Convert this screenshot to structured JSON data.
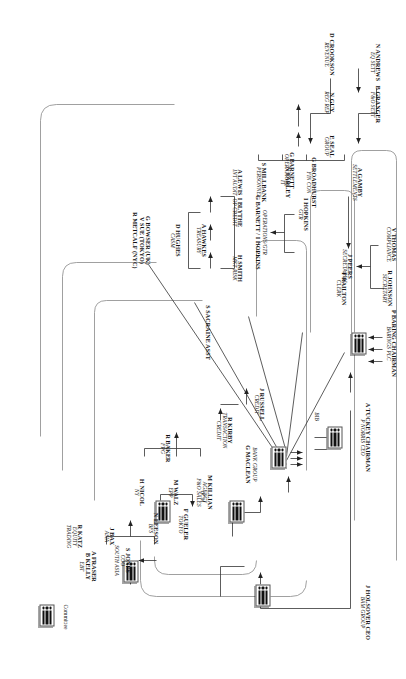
{
  "chart": {
    "type": "org-chart",
    "orientation": "rotated-90-clockwise"
  },
  "legend": {
    "committee_label": "Committee"
  },
  "nodes": {
    "baring": {
      "name": "P BARING CHAIRMAN",
      "role": "BARINGS PLC"
    },
    "tuckey": {
      "name": "A TUCKEY CHAIRMAN",
      "role": "P NORRIS CEO",
      "tag": "BIB"
    },
    "sacraine": {
      "name": "S SACRAINE ASST",
      "role": ""
    },
    "peers": {
      "name": "J PEERS",
      "role": "SECRETARIAL"
    },
    "johnson": {
      "name": "R JOHNSON",
      "role": "SECRETARY"
    },
    "railton": {
      "name": "T RAILTON",
      "role": "CLERK"
    },
    "thomas": {
      "name": "V THOMAS",
      "role": "COMPLIANCE"
    },
    "opsgtr": {
      "name": "OPERATIONS/GTR",
      "role": "G BARNETT / I HOPKINS"
    },
    "hopkins": {
      "name": "I HOPKINS",
      "role": "GTR"
    },
    "barnett": {
      "name": "G BARNETT",
      "role": "OPERATIONS"
    },
    "andrews": {
      "name": "N ANDREWS",
      "role": "EQ SETT"
    },
    "granger": {
      "name": "B GRANGER",
      "role": "F&O SETT"
    },
    "crookson": {
      "name": "D CROOKSON",
      "role": "REVENUE"
    },
    "guy": {
      "name": "N GUY",
      "role": "REG REP"
    },
    "seal": {
      "name": "E SEAL",
      "role": "GROUP"
    },
    "gamby": {
      "name": "A GAMBY",
      "role": "SETTLEMENTS"
    },
    "broadhurst": {
      "name": "G BROADHURST",
      "role": "FIN CON"
    },
    "farley": {
      "name": "N FARLEY",
      "role": "IT"
    },
    "millbank": {
      "name": "S MILLBANK",
      "role": "PERSONNEL"
    },
    "lewis": {
      "name": "A LEWIS",
      "role": "INT AUDIT"
    },
    "smith": {
      "name": "H SMITH",
      "role": "MKT RISK"
    },
    "hawkes": {
      "name": "A HAWKES",
      "role": "TREASURY"
    },
    "hughes": {
      "name": "D HUGHES",
      "role": "CASM"
    },
    "blythe": {
      "name": "I BLYTHE",
      "role": "OP CREDIT"
    },
    "bowser": {
      "name": "G BOWSER (UK)",
      "role": "V SUE (TOKYO)",
      "role2": "R METCALF (NYC)"
    },
    "russell": {
      "name": "J RUSSELL",
      "role": "CREDIT"
    },
    "kirby": {
      "name": "R KIRBY",
      "role": "TRANSACTION",
      "role2": "CREDIT"
    },
    "bankgroup": {
      "name": "BANK GROUP",
      "role": "G MACLEAN"
    },
    "bcm": {
      "name": "",
      "role": "BCM"
    },
    "baker": {
      "name": "R BAKER",
      "role": "FPG"
    },
    "nicol": {
      "name": "H NICOL",
      "role": "NY"
    },
    "walz": {
      "name": "M WALZ",
      "role": "EPP"
    },
    "killian": {
      "name": "M KILLIAN",
      "role": "AGENCY",
      "role2": "F&O SALES"
    },
    "gueler": {
      "name": "F GUELER",
      "role": "TOKYO"
    },
    "leeson": {
      "name": "N LEESON",
      "role": "BFS"
    },
    "jones": {
      "name": "S JONES",
      "role": "COO",
      "role2": "SOUTH ASIA"
    },
    "bax": {
      "name": "J BAX",
      "role": "ASIA"
    },
    "katz": {
      "name": "R KATZ",
      "role": "EQUITY",
      "role2": "TRADING"
    },
    "fraser": {
      "name": "A FRASER",
      "role": "B KELLY",
      "role2": "EBT"
    },
    "holsover": {
      "name": "J HOLSOVER CEO",
      "role": "BAM GROUP"
    }
  }
}
